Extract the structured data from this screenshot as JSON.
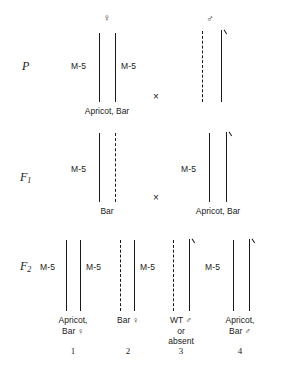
{
  "figure": {
    "kind": "genetic-cross-diagram",
    "organism_notation": "Drosophila X-chromosome cross with M-5 (Muller-5) balancer",
    "line_color": "#1a1a1a",
    "background": "#ffffff"
  },
  "symbols": {
    "female": "♀",
    "male": "♂",
    "cross": "×"
  },
  "generations": [
    {
      "id": "P",
      "label": "P",
      "sub": ""
    },
    {
      "id": "F1",
      "label": "F",
      "sub": "1"
    },
    {
      "id": "F2",
      "label": "F",
      "sub": "2"
    }
  ],
  "rows": {
    "P": {
      "cross_symbol": "×",
      "parents": [
        {
          "name": "p-female",
          "sex_symbol": "♀",
          "markers": [
            "M-5",
            "M-5"
          ],
          "phenotype": "Apricot, Bar",
          "chromosomes": [
            "solid",
            "solid"
          ]
        },
        {
          "name": "p-male",
          "sex_symbol": "♂",
          "markers": [],
          "phenotype": "",
          "chromosomes": [
            "dashed",
            "solid-y"
          ]
        }
      ]
    },
    "F1": {
      "cross_symbol": "×",
      "parents": [
        {
          "name": "f1-female",
          "sex_symbol": "",
          "markers": [
            "M-5"
          ],
          "phenotype": "Bar",
          "chromosomes": [
            "solid",
            "dashed"
          ]
        },
        {
          "name": "f1-male",
          "sex_symbol": "",
          "markers": [
            "M-5"
          ],
          "phenotype": "Apricot, Bar",
          "chromosomes": [
            "solid",
            "solid-y"
          ]
        }
      ]
    },
    "F2": {
      "offspring": [
        {
          "number": "1",
          "name": "f2-offspring-1",
          "markers": [
            "M-5",
            "M-5"
          ],
          "phenotype_lines": [
            "Apricot,",
            "Bar ♀"
          ],
          "chromosomes": [
            "solid",
            "solid"
          ]
        },
        {
          "number": "2",
          "name": "f2-offspring-2",
          "markers": [
            "M-5"
          ],
          "phenotype_lines": [
            "Bar ♀"
          ],
          "chromosomes": [
            "dashed",
            "solid"
          ]
        },
        {
          "number": "3",
          "name": "f2-offspring-3",
          "markers": [],
          "phenotype_lines": [
            "WT ♂",
            "or",
            "absent"
          ],
          "chromosomes": [
            "dashed",
            "solid-y"
          ]
        },
        {
          "number": "4",
          "name": "f2-offspring-4",
          "markers": [
            "M-5"
          ],
          "phenotype_lines": [
            "Apricot,",
            "Bar ♂"
          ],
          "chromosomes": [
            "solid",
            "solid-y"
          ]
        }
      ]
    }
  },
  "text": {
    "p_label": "P",
    "f1_label": "F",
    "f1_sub": "1",
    "f2_label": "F",
    "f2_sub": "2",
    "m5": "M-5",
    "apricot_bar": "Apricot, Bar",
    "bar": "Bar",
    "apricot_comma": "Apricot,",
    "bar_female": "Bar ♀",
    "bar_male": "Bar ♂",
    "wt_male": "WT ♂",
    "or": "or",
    "absent": "absent",
    "n1": "1",
    "n2": "2",
    "n3": "3",
    "n4": "4",
    "cross1": "×",
    "cross2": "×",
    "female_glyph": "♀",
    "male_glyph": "♂"
  }
}
